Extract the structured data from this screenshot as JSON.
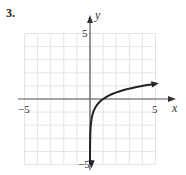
{
  "problem_label": "3.",
  "chart_data": {
    "type": "line",
    "title": "",
    "xlabel": "x",
    "ylabel": "y",
    "xlim": [
      -5,
      5
    ],
    "ylim": [
      -5,
      5
    ],
    "grid": true,
    "x_tick_labels": [
      "-5",
      "5"
    ],
    "y_tick_labels": [
      "5",
      "-5"
    ],
    "series": [
      {
        "name": "logarithmic curve",
        "description": "increasing logarithmic curve with vertical asymptote x=0, passes through (1,0), arrows at both ends",
        "x": [
          0.01,
          0.02,
          0.05,
          0.1,
          0.2,
          0.4,
          0.7,
          1,
          1.5,
          2,
          3,
          4,
          5
        ],
        "y": [
          -3.3,
          -2.8,
          -2.2,
          -1.7,
          -1.2,
          -0.66,
          -0.26,
          0,
          0.29,
          0.5,
          0.79,
          1.0,
          1.16
        ]
      }
    ],
    "colors": {
      "curve": "#222222",
      "axes": "#555555",
      "grid": "#e4e4e4"
    }
  },
  "axes_text": {
    "x_label": "x",
    "y_label": "y",
    "x_min": "−5",
    "x_max": "5",
    "y_max": "5",
    "y_min": "−5"
  }
}
